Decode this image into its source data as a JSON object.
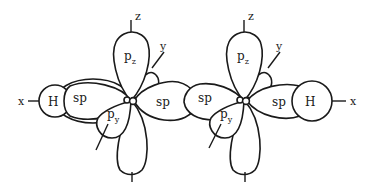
{
  "diagram": {
    "axes": {
      "x": "x",
      "y": "y",
      "z": "z"
    },
    "left_atom": {
      "hydrogen_label": "H",
      "sp_left_label": "sp",
      "sp_right_label": "sp",
      "pz_label": "p",
      "pz_sub": "z",
      "py_label": "p",
      "py_sub": "y"
    },
    "right_atom": {
      "hydrogen_label": "H",
      "sp_left_label": "sp",
      "sp_right_label": "sp",
      "pz_label": "p",
      "pz_sub": "z",
      "py_label": "p",
      "py_sub": "y"
    },
    "colors": {
      "stroke": "#1a1a1a",
      "fill": "#ffffff"
    }
  }
}
